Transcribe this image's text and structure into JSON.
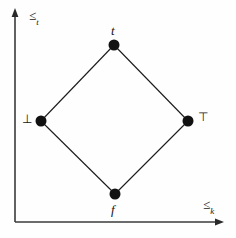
{
  "figure": {
    "kind": "bilattice-diagram",
    "width": 236,
    "height": 238,
    "background_color": "#fefefe",
    "line_color": "#1a1a1a",
    "node_color": "#111111",
    "axis_color": "#3a3a3a"
  },
  "axes": {
    "vertical": {
      "label_symbol": "≤",
      "label_subscript": "t",
      "direction": "up",
      "x": 15,
      "y_top": 10,
      "y_bottom": 222
    },
    "horizontal": {
      "label_symbol": "≤",
      "label_subscript": "k",
      "direction": "right",
      "y": 222,
      "x_left": 15,
      "x_right": 222
    }
  },
  "nodes": [
    {
      "id": "top",
      "label": "t",
      "italic": true,
      "x": 114,
      "y": 45,
      "radius": 5.5,
      "label_position": "above"
    },
    {
      "id": "left",
      "label": "⊥",
      "italic": false,
      "x": 41,
      "y": 121,
      "radius": 5.5,
      "label_position": "left"
    },
    {
      "id": "right",
      "label": "⊤",
      "italic": false,
      "x": 188,
      "y": 121,
      "radius": 5.5,
      "label_position": "right"
    },
    {
      "id": "bottom",
      "label": "f",
      "italic": true,
      "x": 115,
      "y": 194,
      "radius": 5.5,
      "label_position": "below"
    }
  ],
  "edges": [
    {
      "from": "left",
      "to": "top"
    },
    {
      "from": "top",
      "to": "right"
    },
    {
      "from": "right",
      "to": "bottom"
    },
    {
      "from": "bottom",
      "to": "left"
    }
  ]
}
